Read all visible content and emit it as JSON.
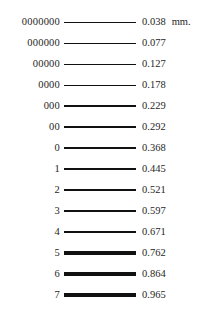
{
  "chart_data": {
    "type": "table",
    "title": "",
    "xlabel": "",
    "ylabel": "",
    "unit": "mm.",
    "unit_shown_on_row": 0,
    "columns": [
      "gauge",
      "rule",
      "thickness_mm"
    ],
    "categories": [
      "0000000",
      "000000",
      "00000",
      "0000",
      "000",
      "00",
      "0",
      "1",
      "2",
      "3",
      "4",
      "5",
      "6",
      "7"
    ],
    "values": [
      0.038,
      0.077,
      0.127,
      0.178,
      0.229,
      0.292,
      0.368,
      0.445,
      0.521,
      0.597,
      0.671,
      0.762,
      0.864,
      0.965
    ],
    "rule_thickness_px": [
      0.7,
      0.8,
      0.9,
      1.0,
      1.1,
      1.3,
      1.5,
      1.8,
      2.1,
      2.4,
      2.7,
      3.1,
      3.5,
      4.0
    ],
    "colors": {
      "background": "#ffffff",
      "text": "#262626",
      "rule": "#111111"
    }
  },
  "rows": [
    {
      "gauge": "0000000",
      "value": "0.038",
      "unit": "mm.",
      "thickness": 0.7,
      "top": 14
    },
    {
      "gauge": "000000",
      "value": "0.077",
      "unit": "",
      "thickness": 0.8,
      "top": 35
    },
    {
      "gauge": "00000",
      "value": "0.127",
      "unit": "",
      "thickness": 0.9,
      "top": 56
    },
    {
      "gauge": "0000",
      "value": "0.178",
      "unit": "",
      "thickness": 1.0,
      "top": 77
    },
    {
      "gauge": "000",
      "value": "0.229",
      "unit": "",
      "thickness": 1.1,
      "top": 98
    },
    {
      "gauge": "00",
      "value": "0.292",
      "unit": "",
      "thickness": 1.3,
      "top": 119
    },
    {
      "gauge": "0",
      "value": "0.368",
      "unit": "",
      "thickness": 1.5,
      "top": 140
    },
    {
      "gauge": "1",
      "value": "0.445",
      "unit": "",
      "thickness": 1.8,
      "top": 161
    },
    {
      "gauge": "2",
      "value": "0.521",
      "unit": "",
      "thickness": 2.1,
      "top": 182
    },
    {
      "gauge": "3",
      "value": "0.597",
      "unit": "",
      "thickness": 2.4,
      "top": 203
    },
    {
      "gauge": "4",
      "value": "0.671",
      "unit": "",
      "thickness": 2.7,
      "top": 224
    },
    {
      "gauge": "5",
      "value": "0.762",
      "unit": "",
      "thickness": 3.1,
      "top": 245
    },
    {
      "gauge": "6",
      "value": "0.864",
      "unit": "",
      "thickness": 3.5,
      "top": 266
    },
    {
      "gauge": "7",
      "value": "0.965",
      "unit": "",
      "thickness": 4.0,
      "top": 287
    }
  ]
}
